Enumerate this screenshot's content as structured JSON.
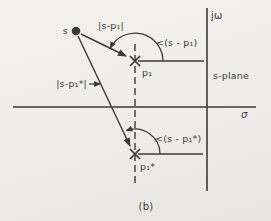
{
  "figure": {
    "caption": "(b)",
    "plane_label": "s-plane",
    "axis": {
      "vertical_label": "jω",
      "horizontal_label": "σ"
    },
    "point_s": {
      "label": "s"
    },
    "pole_p1": {
      "label": "p₁",
      "magnitude_label": "|s-p₁|",
      "angle_label": "<(s - p₁)"
    },
    "pole_p1_conjugate": {
      "label": "p₁*",
      "magnitude_label": "|s-p₁*|",
      "angle_label": "<(s - p₁*)"
    },
    "colors": {
      "ink": "#3a3a3a",
      "paper": "#f0eeea"
    }
  }
}
